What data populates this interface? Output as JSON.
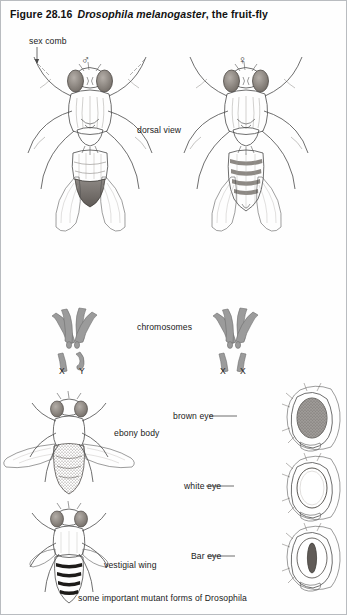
{
  "figure": {
    "number": "Figure 28.16",
    "species": "Drosophila melanogaster",
    "title_tail": ", the fruit-fly",
    "caption": "some important mutant forms of ",
    "caption_italic": "Drosophila"
  },
  "labels": {
    "sex_comb": "sex comb",
    "dorsal_view": "dorsal view",
    "chromosomes": "chromosomes",
    "male_symbol": "♂",
    "female_symbol": "♀",
    "male_karyotype": "X  Y",
    "male_karyotype_x": "X",
    "male_karyotype_y": "Y",
    "female_karyotype_x1": "X",
    "female_karyotype_x2": "X",
    "ebony_body": "ebony body",
    "vestigial_wing": "vestigial wing",
    "brown_eye": "brown eye",
    "white_eye": "white eye",
    "bar_eye": "Bar eye"
  },
  "colors": {
    "border": "#b9bcc0",
    "ink": "#4a4a4a",
    "ink_dark": "#2e2e2e",
    "chromosome_fill": "#9b9b9b",
    "eye_shade": "#8f8a85",
    "abdomen_dark": "#6f6a66",
    "background": "#ffffff"
  }
}
